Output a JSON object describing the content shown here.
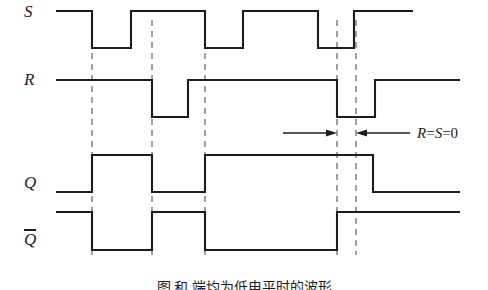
{
  "figure": {
    "type": "digital-timing-diagram",
    "background_color": "#ffffff",
    "line_color": "#1c1c1c",
    "dash_color": "#777777",
    "width": 488,
    "height": 287
  },
  "labels": {
    "s": "S",
    "r": "R",
    "q": "Q",
    "qbar": "Q"
  },
  "annotation": {
    "text_r": "R",
    "eq1": "=",
    "text_s": "S",
    "eq2": "=",
    "value": "0",
    "full": "R=S=0"
  },
  "caption": {
    "text": "图                  和        端均为低电平时的波形"
  },
  "chart_data": {
    "type": "line",
    "title": "",
    "xlabel": "",
    "ylabel": "",
    "x": [
      56,
      92,
      131,
      152,
      188,
      205,
      243,
      318,
      337,
      354,
      356,
      373,
      375,
      413,
      460
    ],
    "axis_range_x": [
      56,
      460
    ],
    "grid": false,
    "legend_position": "left",
    "dashed_guides": [
      92,
      152,
      205,
      337,
      356
    ],
    "series": [
      {
        "name": "S",
        "label": "S",
        "high_y": 11,
        "low_y": 48,
        "initial_level": 1,
        "transitions": [
          {
            "x": 92,
            "to": 0
          },
          {
            "x": 131,
            "to": 1
          },
          {
            "x": 205,
            "to": 0
          },
          {
            "x": 243,
            "to": 1
          },
          {
            "x": 318,
            "to": 0
          },
          {
            "x": 354,
            "to": 1
          }
        ],
        "end_x": 413
      },
      {
        "name": "R",
        "label": "R",
        "high_y": 80,
        "low_y": 117,
        "initial_level": 1,
        "transitions": [
          {
            "x": 152,
            "to": 0
          },
          {
            "x": 188,
            "to": 1
          },
          {
            "x": 337,
            "to": 0
          },
          {
            "x": 375,
            "to": 1
          }
        ],
        "end_x": 460
      },
      {
        "name": "Q",
        "label": "Q",
        "high_y": 155,
        "low_y": 192,
        "initial_level": 0,
        "transitions": [
          {
            "x": 92,
            "to": 1
          },
          {
            "x": 152,
            "to": 0
          },
          {
            "x": 205,
            "to": 1
          },
          {
            "x": 373,
            "to": 0
          }
        ],
        "end_x": 460
      },
      {
        "name": "Qbar",
        "label": "Q",
        "overline": true,
        "high_y": 212,
        "low_y": 250,
        "initial_level": 1,
        "transitions": [
          {
            "x": 92,
            "to": 0
          },
          {
            "x": 152,
            "to": 1
          },
          {
            "x": 205,
            "to": 0
          },
          {
            "x": 337,
            "to": 1
          }
        ],
        "end_x": 460
      }
    ],
    "arrows": [
      {
        "name": "left-arrow",
        "from_x": 283,
        "to_x": 337,
        "y": 133,
        "direction": "right"
      },
      {
        "name": "right-arrow",
        "from_x": 410,
        "to_x": 356,
        "y": 133,
        "direction": "left"
      }
    ]
  }
}
